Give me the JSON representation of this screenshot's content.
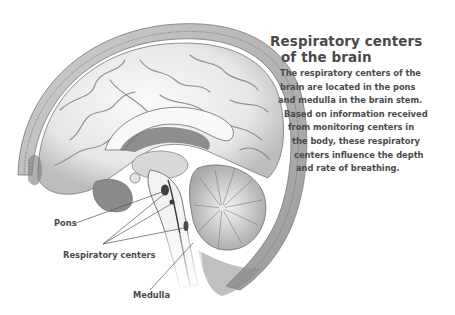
{
  "title": {
    "line1": "Respiratory centers",
    "line2": "of the brain"
  },
  "description": {
    "lines": [
      "The respiratory centers of the",
      "brain are located in the pons",
      "and medulla in the brain stem.",
      "Based on information received",
      "from monitoring centers in",
      "the body, these respiratory",
      "centers influence the depth",
      "and rate of breathing."
    ],
    "indents": [
      0,
      0,
      -2,
      4,
      8,
      12,
      14,
      16
    ]
  },
  "labels": {
    "pons": "Pons",
    "respiratory_centers": "Respiratory centers",
    "medulla": "Medulla"
  },
  "illustration": {
    "subject": "sagittal-section-human-brain",
    "colors": {
      "skull": "#b8b8b8",
      "skull_inner": "#dcdcdc",
      "brain": "#f0f0f0",
      "shadow": "#8a8a8a",
      "outline": "#6a6a6a",
      "leader_line": "#555555"
    }
  }
}
